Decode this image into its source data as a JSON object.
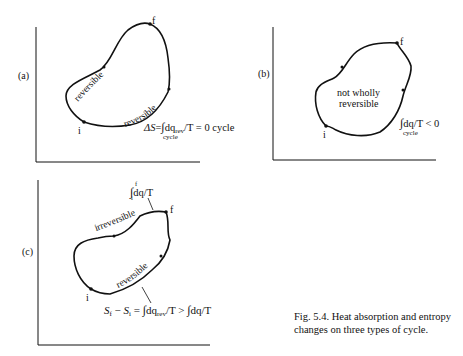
{
  "figure": {
    "caption": "Fig. 5.4.  Heat absorption and entropy changes on three types of cycle.",
    "panels": [
      {
        "id": "a",
        "label": "(a)",
        "start_point": "i",
        "end_point": "f",
        "upper_path_label": "reversible",
        "lower_path_label": "reversible",
        "equation": {
          "lhs": "ΔS",
          "eq": "=",
          "integral": "∫",
          "integrand": "dq",
          "subscript": "rev",
          "rest": "/T = 0 cycle",
          "limit": "cycle"
        }
      },
      {
        "id": "b",
        "label": "(b)",
        "start_point": "i",
        "end_point": "f",
        "center_text_line1": "not  wholly",
        "center_text_line2": "reversible",
        "equation": {
          "integral": "∫",
          "integrand": "dq",
          "rest": "/T < 0",
          "limit": "cycle"
        }
      },
      {
        "id": "c",
        "label": "(c)",
        "start_point": "i",
        "end_point": "f",
        "upper_path_label": "irreversible",
        "lower_path_label": "reversible",
        "top_equation": {
          "integral": "∫",
          "upper_limit": "f",
          "lower_limit": "i",
          "integrand": "dq",
          "rest": "/T"
        },
        "bottom_equation": {
          "lhs_a": "S",
          "lhs_a_sub": "f",
          "minus": " − ",
          "lhs_b": "S",
          "lhs_b_sub": "i",
          "eq": " = ",
          "integral": "∫",
          "upper_limit": "f",
          "lower_limit": "i",
          "integrand": "dq",
          "subscript": "rev",
          "mid": "/T > ",
          "integral2": "∫",
          "upper_limit2": "f",
          "lower_limit2": "i",
          "integrand2": "dq",
          "rest2": "/T"
        }
      }
    ]
  }
}
